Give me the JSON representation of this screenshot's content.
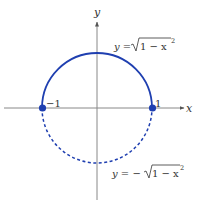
{
  "figure": {
    "axes": {
      "x_label": "x",
      "y_label": "y",
      "tick_neg": "−1",
      "tick_pos": "1"
    },
    "curves": {
      "upper": {
        "label_lhs": "y = ",
        "label_radicand": "1 − x",
        "label_exp": "2",
        "style": "solid"
      },
      "lower": {
        "label_lhs": "y = −",
        "label_radicand": "1 − x",
        "label_exp": "2",
        "style": "dashed"
      }
    },
    "points": [
      {
        "x": -1,
        "y": 0
      },
      {
        "x": 1,
        "y": 0
      }
    ],
    "colors": {
      "curve": "#1f3fb0",
      "axis": "#555555",
      "text": "#333333"
    }
  }
}
